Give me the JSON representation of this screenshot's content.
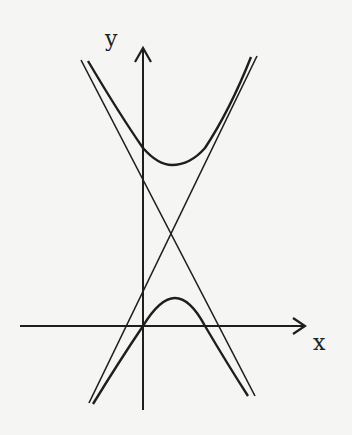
{
  "diagram": {
    "title": "",
    "axis_labels": {
      "x": "x",
      "y": "y"
    },
    "elements": [
      {
        "id": "x-axis",
        "kind": "axis",
        "description": "horizontal axis with arrow"
      },
      {
        "id": "y-axis",
        "kind": "axis",
        "description": "vertical axis with arrow"
      },
      {
        "id": "asymptote-1",
        "kind": "line",
        "description": "decreasing asymptote"
      },
      {
        "id": "asymptote-2",
        "kind": "line",
        "description": "increasing asymptote"
      },
      {
        "id": "upper-branch",
        "kind": "curve",
        "description": "upper hyperbola branch opening upward"
      },
      {
        "id": "lower-branch",
        "kind": "curve",
        "description": "lower hyperbola branch opening downward"
      }
    ],
    "stroke_color": "#1e1e1e",
    "background": "#f5f5f3"
  }
}
